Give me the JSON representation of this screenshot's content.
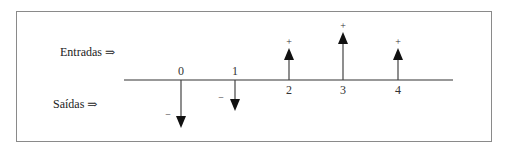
{
  "diagram": {
    "title": "",
    "labels": {
      "inflows": "Entradas ⇒",
      "outflows": "Saídas ⇒"
    },
    "timeline": {
      "ticks": [
        "0",
        "1",
        "2",
        "3",
        "4"
      ]
    },
    "cash_flows": [
      {
        "period": "0",
        "direction": "out",
        "sign": "−",
        "relative_magnitude": 47
      },
      {
        "period": "1",
        "direction": "out",
        "sign": "−",
        "relative_magnitude": 30
      },
      {
        "period": "2",
        "direction": "in",
        "sign": "+",
        "relative_magnitude": 31
      },
      {
        "period": "3",
        "direction": "in",
        "sign": "+",
        "relative_magnitude": 47
      },
      {
        "period": "4",
        "direction": "in",
        "sign": "+",
        "relative_magnitude": 31
      }
    ],
    "colors": {
      "border": "#8a8a8a",
      "line": "#333333",
      "arrow": "#111111"
    }
  }
}
